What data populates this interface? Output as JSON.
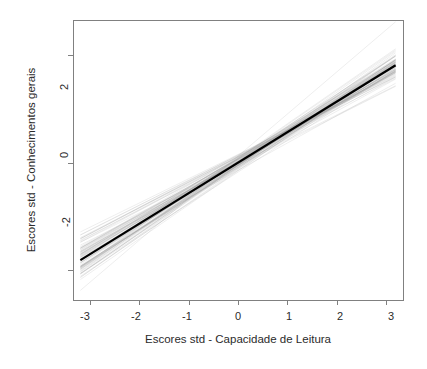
{
  "chart_data": {
    "type": "line",
    "title": "",
    "subtitle": "",
    "xlabel": "Escores std - Capacidade de Leitura",
    "ylabel": "Escores std - Conhecimentos gerais",
    "xlim": [
      -3.35,
      3.35
    ],
    "ylim": [
      -2.55,
      2.65
    ],
    "xticks": [
      -3,
      -2,
      -1,
      0,
      1,
      2,
      3
    ],
    "xtick_labels": [
      "-3",
      "-2",
      "-1",
      "0",
      "1",
      "2",
      "3"
    ],
    "yticks": [
      -2,
      0,
      2
    ],
    "ytick_labels": [
      "-2",
      "0",
      "2"
    ],
    "grid": false,
    "legend": "none",
    "box": true,
    "background": "#ffffff",
    "axis_color": "#808080",
    "text_color": "#2b2b2b",
    "x_domain": [
      -3.2,
      3.2
    ],
    "series": [
      {
        "name": "Regressao media (linha grossa)",
        "type": "line",
        "color": "#000000",
        "width": 2.2,
        "opacity": 1,
        "intercept": 0.0,
        "slope": 0.565,
        "x": [
          -3.2,
          3.2
        ],
        "values": [
          -1.81,
          1.81
        ]
      },
      {
        "name": "Amostras posteriores (linhas cinza)",
        "type": "line-bundle",
        "color": "#9a9a9a",
        "width": 0.5,
        "opacity": 0.35,
        "count": 80,
        "pivot_x": -3.2,
        "intercepts": [
          -0.02,
          0.05,
          -0.08,
          0.11,
          0.02,
          -0.05,
          0.08,
          -0.11,
          0.0,
          0.06,
          -0.03,
          0.09,
          -0.07,
          0.04,
          -0.01,
          0.12,
          -0.09,
          0.03,
          0.07,
          -0.04,
          0.1,
          -0.06,
          0.01,
          -0.12,
          0.05,
          0.08,
          -0.02,
          0.06,
          -0.1,
          0.03,
          0.0,
          -0.07,
          0.09,
          0.02,
          -0.05,
          0.11,
          -0.03,
          0.07,
          -0.08,
          0.04,
          0.01,
          -0.11,
          0.06,
          -0.02,
          0.1,
          -0.06,
          0.03,
          0.08,
          -0.04,
          0.0,
          0.05,
          -0.09,
          0.07,
          -0.01,
          0.12,
          -0.07,
          0.02,
          0.09,
          -0.03,
          0.06,
          -0.1,
          0.04,
          0.0,
          -0.05,
          0.11,
          0.01,
          -0.08,
          0.07,
          -0.02,
          0.1,
          0.03,
          -0.06,
          0.05,
          -0.11,
          0.08,
          0.02,
          -0.04,
          0.09,
          -0.01,
          0.06
        ],
        "slopes": [
          0.565,
          0.52,
          0.61,
          0.48,
          0.59,
          0.55,
          0.63,
          0.5,
          0.57,
          0.54,
          0.6,
          0.46,
          0.62,
          0.53,
          0.58,
          0.49,
          0.64,
          0.56,
          0.51,
          0.6,
          0.47,
          0.61,
          0.55,
          0.58,
          0.52,
          0.63,
          0.5,
          0.57,
          0.6,
          0.54,
          0.45,
          0.62,
          0.48,
          0.59,
          0.56,
          0.51,
          0.65,
          0.53,
          0.6,
          0.57,
          0.49,
          0.61,
          0.55,
          0.58,
          0.47,
          0.63,
          0.52,
          0.56,
          0.6,
          0.54,
          0.5,
          0.62,
          0.57,
          0.59,
          0.46,
          0.64,
          0.53,
          0.55,
          0.61,
          0.51,
          0.58,
          0.6,
          0.48,
          0.56,
          0.63,
          0.52,
          0.59,
          0.54,
          0.57,
          0.5,
          0.62,
          0.55,
          0.6,
          0.47,
          0.58,
          0.53,
          0.61,
          0.49,
          0.56,
          0.79
        ],
        "note": "Uma linha discrepante com inclinacao alta atinge ~2.55 na borda direita"
      }
    ]
  },
  "geometry": {
    "plot_left": 73,
    "plot_right": 403,
    "plot_top": 20,
    "plot_bottom": 300
  }
}
